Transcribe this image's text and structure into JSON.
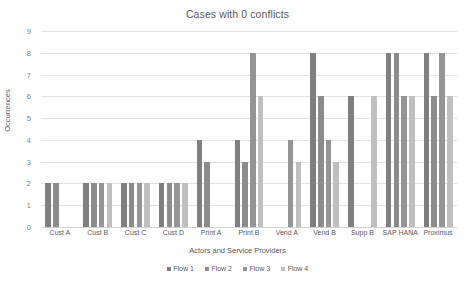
{
  "chart_data": {
    "type": "bar",
    "title": "Cases with 0 conflicts",
    "xlabel": "Actors and Service Providers",
    "ylabel": "Occurrences",
    "ylim": [
      0,
      9
    ],
    "yticks": [
      0,
      1,
      2,
      3,
      4,
      5,
      6,
      7,
      8,
      9
    ],
    "grid": true,
    "legend_position": "bottom",
    "categories": [
      "Cust A",
      "Cust B",
      "Cust C",
      "Cust D",
      "Print A",
      "Print B",
      "Vend A",
      "Vend B",
      "Supp B",
      "SAP HANA",
      "Proximus"
    ],
    "series": [
      {
        "name": "Flow 1",
        "color": "#7f7f7f",
        "values": [
          2,
          2,
          2,
          2,
          4,
          4,
          null,
          8,
          6,
          8,
          8
        ]
      },
      {
        "name": "Flow 2",
        "color": "#8c8c8c",
        "values": [
          2,
          2,
          2,
          2,
          3,
          3,
          null,
          6,
          null,
          8,
          6
        ]
      },
      {
        "name": "Flow 3",
        "color": "#959595",
        "values": [
          null,
          2,
          2,
          2,
          null,
          8,
          4,
          4,
          null,
          6,
          8
        ]
      },
      {
        "name": "Flow 4",
        "color": "#bfbfbf",
        "values": [
          null,
          2,
          2,
          2,
          null,
          6,
          3,
          3,
          6,
          6,
          6
        ]
      }
    ]
  },
  "colors": {
    "gridline": "#e2e2e2",
    "axis_text": "#808080",
    "label_text": "#595959",
    "background": "#ffffff"
  }
}
